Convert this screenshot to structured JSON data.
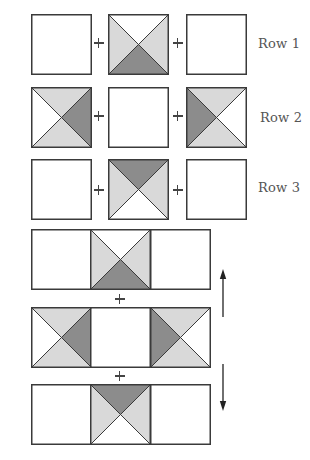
{
  "colors": {
    "light": "#d9d9d9",
    "dark": "#8c8c8c",
    "white": "#ffffff",
    "stroke": "#3a3a3a"
  },
  "row_labels": [
    "Row 1",
    "Row 2",
    "Row 3"
  ],
  "separate_rows": [
    {
      "label": "Row 1",
      "y": 14,
      "blocks": [
        {
          "x": 31,
          "triangles": {
            "top": "white",
            "right": "white",
            "bottom": "white",
            "left": "white"
          },
          "plain": true
        },
        {
          "x": 108,
          "triangles": {
            "top": "white",
            "right": "light",
            "bottom": "dark",
            "left": "light"
          },
          "plain": false
        },
        {
          "x": 186,
          "triangles": {
            "top": "white",
            "right": "white",
            "bottom": "white",
            "left": "white"
          },
          "plain": true
        }
      ]
    },
    {
      "label": "Row 2",
      "y": 87,
      "blocks": [
        {
          "x": 31,
          "triangles": {
            "top": "light",
            "right": "dark",
            "bottom": "light",
            "left": "white"
          },
          "plain": false
        },
        {
          "x": 108,
          "triangles": {
            "top": "white",
            "right": "white",
            "bottom": "white",
            "left": "white"
          },
          "plain": true
        },
        {
          "x": 186,
          "triangles": {
            "top": "light",
            "right": "white",
            "bottom": "light",
            "left": "dark"
          },
          "plain": false
        }
      ]
    },
    {
      "label": "Row 3",
      "y": 159,
      "blocks": [
        {
          "x": 31,
          "triangles": {
            "top": "white",
            "right": "white",
            "bottom": "white",
            "left": "white"
          },
          "plain": true
        },
        {
          "x": 108,
          "triangles": {
            "top": "dark",
            "right": "light",
            "bottom": "white",
            "left": "light"
          },
          "plain": false
        },
        {
          "x": 186,
          "triangles": {
            "top": "white",
            "right": "white",
            "bottom": "white",
            "left": "white"
          },
          "plain": true
        }
      ]
    }
  ],
  "joined_rows": [
    {
      "y": 229,
      "middle_block": "Row 1"
    },
    {
      "y": 307,
      "middle_block": "Row 2"
    },
    {
      "y": 384,
      "middle_block": "Row 3"
    }
  ],
  "symbols": {
    "plus": "+",
    "arrow_up": "up-arrow",
    "arrow_down": "down-arrow"
  }
}
